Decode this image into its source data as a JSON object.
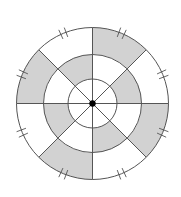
{
  "diagram": {
    "type": "concentric-circle-sector-diagram",
    "center": {
      "x": 92.5,
      "y": 103.5
    },
    "radii": {
      "inner": 24.5,
      "middle": 49,
      "outer": 76
    },
    "sectors": 8,
    "colors": {
      "stroke": "#555555",
      "shade": "#d2d2d2",
      "blank": "#ffffff",
      "center_dot": "#000000"
    },
    "rings": {
      "inner": {
        "shaded": [
          false,
          false,
          false,
          false,
          false,
          false,
          false,
          false
        ]
      },
      "middle": {
        "shaded": [
          false,
          true,
          false,
          true,
          false,
          true,
          false,
          true
        ]
      },
      "outer": {
        "shaded": [
          true,
          false,
          true,
          false,
          true,
          false,
          true,
          false
        ]
      }
    },
    "sector_order_note": "sectors indexed clockwise starting at top (0deg = up), 45deg each",
    "tick_marks": {
      "count": 8,
      "style": "double-hash",
      "angles_deg": [
        22.5,
        67.5,
        112.5,
        157.5,
        202.5,
        247.5,
        292.5,
        337.5
      ]
    },
    "center_dot_radius": 3.2
  }
}
